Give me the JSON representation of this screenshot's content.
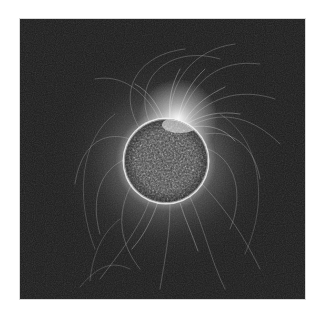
{
  "image": {
    "subject": "solar corona with magnetic field lines around a star disk",
    "panel": {
      "x": 20,
      "y": 19,
      "width": 285,
      "height": 280
    },
    "colors": {
      "page_background": "#ffffff",
      "panel_background": "#1b1b1b",
      "disk_base": "#3a3a3a",
      "corona_glow": "#ffffff",
      "field_lines": "#cfcfcf"
    },
    "disk": {
      "cx": 146,
      "cy": 142,
      "r": 42
    },
    "active_region": {
      "cx": 158,
      "cy": 100
    }
  }
}
